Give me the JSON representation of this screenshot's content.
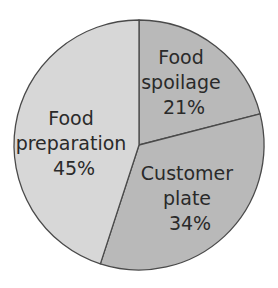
{
  "chart_data": {
    "type": "pie",
    "title": "",
    "categories": [
      "Food spoilage",
      "Customer plate",
      "Food preparation"
    ],
    "values": [
      21,
      34,
      45
    ],
    "unit": "%",
    "start_angle_deg": 0,
    "direction": "clockwise",
    "colors": [
      "#b9b9b9",
      "#b9b9b9",
      "#d7d7d7"
    ],
    "labels": [
      {
        "line1": "Food",
        "line2": "spoilage",
        "value": "21%"
      },
      {
        "line1": "Customer",
        "line2": "plate",
        "value": "34%"
      },
      {
        "line1": "Food",
        "line2": "preparation",
        "value": "45%"
      }
    ],
    "legend": "none",
    "stroke_color": "#4a4a4a"
  }
}
